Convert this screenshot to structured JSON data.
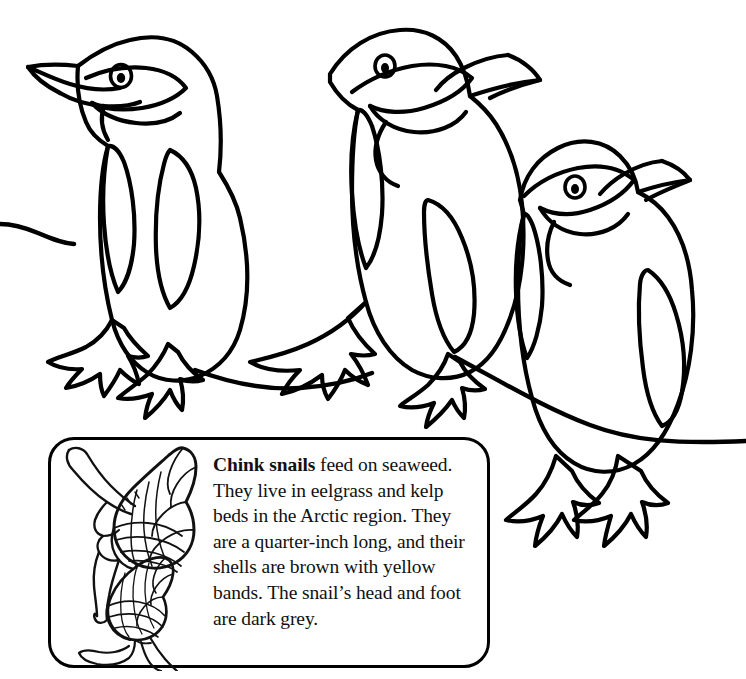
{
  "page": {
    "background_color": "#ffffff",
    "ink_color": "#000000",
    "width": 746,
    "height": 679
  },
  "illustration": {
    "subject": "penguins",
    "style": "black-and-white line art coloring page",
    "count": 3,
    "figures": [
      {
        "name": "penguin-left",
        "facing": "left",
        "pose": "standing"
      },
      {
        "name": "penguin-middle",
        "facing": "right",
        "pose": "standing-leaning"
      },
      {
        "name": "penguin-right",
        "facing": "right",
        "pose": "standing"
      }
    ],
    "ground_lines": 3
  },
  "factbox": {
    "name": "chink-snails-fact-box",
    "border_color": "#000000",
    "border_radius_px": 26,
    "illustrations": [
      {
        "name": "snail-large",
        "subject": "chink snail with banded shell and extended foot"
      },
      {
        "name": "snail-small",
        "subject": "chink snail with banded shell and extended foot"
      }
    ],
    "heading": "Chink snails",
    "body": " feed on seaweed. They live in eelgrass and kelp beds in the Arctic region. They are a quarter-inch long, and their shells are brown with yellow bands. The snail’s head and foot are dark grey.",
    "full_text": "Chink snails feed on seaweed. They live in eelgrass and kelp beds in the Arctic region. They are a quarter-inch long, and their shells are brown with yellow bands. The snail’s head and foot are dark grey."
  }
}
